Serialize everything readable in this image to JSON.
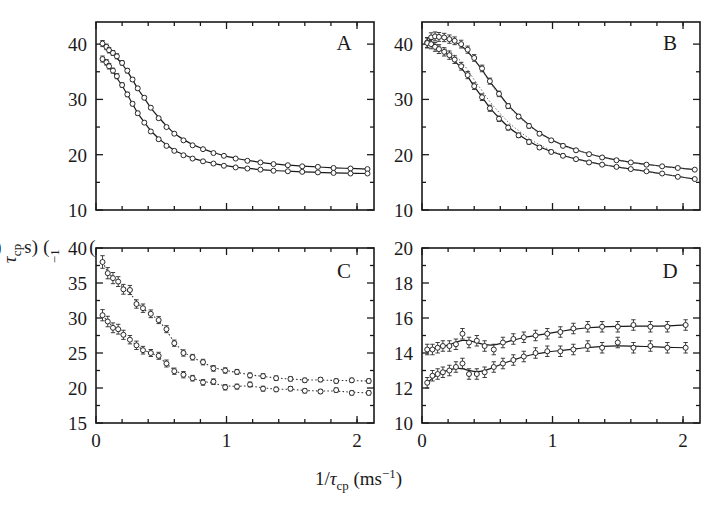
{
  "figure": {
    "axis": {
      "ylabel_prefix": "R",
      "ylabel_sub": "eff",
      "ylabel_mid": "(1/",
      "ylabel_tau": "τ",
      "ylabel_tau_sub": "cp",
      "ylabel_close": ") (s",
      "ylabel_sup": "−1",
      "ylabel_end": ")",
      "xlabel_prefix": "1/",
      "xlabel_tau": "τ",
      "xlabel_tau_sub": "cp",
      "xlabel_unit_open": " (ms",
      "xlabel_sup": "−1",
      "xlabel_unit_close": ")"
    },
    "colors": {
      "ink": "#1a1a1a",
      "marker_stroke": "#2b2b2b",
      "marker_fill": "#ffffff",
      "fit_solid": "#1a1a1a",
      "fit_dotted": "#3a3a3a",
      "frame": "#1a1a1a"
    }
  },
  "chart_data": [
    {
      "type": "scatter",
      "panel": "A",
      "label": "A",
      "title": "",
      "xlabel": "1/τcp (ms−1)",
      "ylabel": "Reff(1/τcp) (s−1)",
      "xlim": [
        0,
        2.13
      ],
      "ylim": [
        10,
        44
      ],
      "xticks": [
        0,
        1,
        2
      ],
      "xticklabels": [
        "0",
        "1",
        "2"
      ],
      "xminorticks": [
        0.2,
        0.4,
        0.6,
        0.8,
        1.2,
        1.4,
        1.6,
        1.8,
        2.0
      ],
      "yticks": [
        10,
        20,
        30,
        40
      ],
      "yticklabels": [
        "10",
        "20",
        "30",
        "40"
      ],
      "yminorticks": [
        15,
        25,
        35
      ],
      "grid": false,
      "legend": null,
      "series": [
        {
          "name": "upper-field",
          "fit_style": "solid",
          "x": [
            0.05,
            0.08,
            0.1,
            0.13,
            0.16,
            0.2,
            0.24,
            0.28,
            0.32,
            0.37,
            0.42,
            0.48,
            0.54,
            0.6,
            0.67,
            0.74,
            0.82,
            0.9,
            0.98,
            1.07,
            1.16,
            1.26,
            1.36,
            1.47,
            1.58,
            1.7,
            1.82,
            1.95,
            2.08
          ],
          "y": [
            40.1,
            39.5,
            38.9,
            38.4,
            37.8,
            36.6,
            35.2,
            33.6,
            32.0,
            30.3,
            28.5,
            26.6,
            25.0,
            23.8,
            22.6,
            21.7,
            21.0,
            20.3,
            19.8,
            19.3,
            18.9,
            18.6,
            18.3,
            18.1,
            17.9,
            17.8,
            17.6,
            17.5,
            17.4
          ],
          "yerr": [
            0.55,
            0.5,
            0.5,
            0.45,
            0.45,
            0.4,
            0.4,
            0.35,
            0.35,
            0.3,
            0.3,
            0.3,
            0.25,
            0.25,
            0.25,
            0.22,
            0.22,
            0.2,
            0.2,
            0.2,
            0.2,
            0.18,
            0.18,
            0.18,
            0.18,
            0.18,
            0.18,
            0.18,
            0.18
          ]
        },
        {
          "name": "lower-field",
          "fit_style": "solid",
          "x": [
            0.05,
            0.08,
            0.1,
            0.13,
            0.16,
            0.2,
            0.24,
            0.28,
            0.32,
            0.37,
            0.42,
            0.48,
            0.54,
            0.6,
            0.67,
            0.74,
            0.82,
            0.9,
            0.98,
            1.07,
            1.16,
            1.26,
            1.36,
            1.47,
            1.58,
            1.7,
            1.82,
            1.95,
            2.08
          ],
          "y": [
            37.3,
            36.7,
            36.0,
            35.2,
            34.2,
            32.6,
            30.9,
            29.2,
            27.5,
            25.8,
            24.2,
            22.8,
            21.6,
            20.7,
            19.9,
            19.3,
            18.8,
            18.4,
            18.0,
            17.7,
            17.5,
            17.3,
            17.1,
            17.0,
            16.9,
            16.8,
            16.7,
            16.6,
            16.6
          ],
          "yerr": [
            0.55,
            0.5,
            0.5,
            0.45,
            0.45,
            0.4,
            0.4,
            0.35,
            0.35,
            0.3,
            0.3,
            0.3,
            0.25,
            0.25,
            0.25,
            0.22,
            0.22,
            0.2,
            0.2,
            0.2,
            0.2,
            0.18,
            0.18,
            0.18,
            0.18,
            0.18,
            0.18,
            0.18,
            0.18
          ]
        }
      ]
    },
    {
      "type": "scatter",
      "panel": "B",
      "label": "B",
      "title": "",
      "xlabel": "1/τcp (ms−1)",
      "ylabel": "Reff(1/τcp) (s−1)",
      "xlim": [
        0,
        2.13
      ],
      "ylim": [
        10,
        44
      ],
      "xticks": [
        0,
        1,
        2
      ],
      "xticklabels": [
        "0",
        "1",
        "2"
      ],
      "xminorticks": [
        0.2,
        0.4,
        0.6,
        0.8,
        1.2,
        1.4,
        1.6,
        1.8,
        2.0
      ],
      "yticks": [
        10,
        20,
        30,
        40
      ],
      "yticklabels": [
        "10",
        "20",
        "30",
        "40"
      ],
      "yminorticks": [
        15,
        25,
        35
      ],
      "grid": false,
      "legend": null,
      "series": [
        {
          "name": "upper-field",
          "fit_style": "solid-with-dotted-alt",
          "x": [
            0.04,
            0.07,
            0.1,
            0.13,
            0.17,
            0.21,
            0.25,
            0.3,
            0.35,
            0.4,
            0.46,
            0.52,
            0.59,
            0.66,
            0.74,
            0.82,
            0.9,
            0.99,
            1.08,
            1.18,
            1.28,
            1.38,
            1.49,
            1.6,
            1.72,
            1.84,
            1.96,
            2.09
          ],
          "y": [
            40.3,
            41.2,
            41.4,
            41.3,
            41.2,
            40.9,
            40.6,
            40.0,
            39.0,
            37.5,
            35.6,
            33.3,
            31.0,
            28.8,
            26.9,
            25.2,
            23.8,
            22.6,
            21.6,
            20.8,
            20.1,
            19.5,
            19.0,
            18.6,
            18.2,
            17.9,
            17.6,
            17.3
          ],
          "yerr": [
            0.9,
            0.85,
            0.8,
            0.8,
            0.75,
            0.75,
            0.7,
            0.7,
            0.65,
            0.6,
            0.6,
            0.55,
            0.5,
            0.45,
            0.4,
            0.4,
            0.35,
            0.3,
            0.3,
            0.3,
            0.28,
            0.25,
            0.25,
            0.22,
            0.22,
            0.2,
            0.2,
            0.2
          ]
        },
        {
          "name": "lower-field",
          "fit_style": "solid-with-dotted-alt",
          "x": [
            0.04,
            0.07,
            0.1,
            0.13,
            0.17,
            0.21,
            0.25,
            0.3,
            0.35,
            0.4,
            0.46,
            0.52,
            0.59,
            0.66,
            0.74,
            0.82,
            0.9,
            0.99,
            1.08,
            1.18,
            1.28,
            1.38,
            1.49,
            1.6,
            1.72,
            1.84,
            1.96,
            2.09
          ],
          "y": [
            40.2,
            40.0,
            39.5,
            39.1,
            38.6,
            38.0,
            37.2,
            36.0,
            34.4,
            32.4,
            30.4,
            28.4,
            26.5,
            24.9,
            23.5,
            22.3,
            21.3,
            20.5,
            19.8,
            19.2,
            18.6,
            18.2,
            17.8,
            17.4,
            17.0,
            16.6,
            16.0,
            15.6
          ],
          "yerr": [
            0.9,
            0.85,
            0.8,
            0.8,
            0.75,
            0.75,
            0.7,
            0.7,
            0.65,
            0.6,
            0.6,
            0.55,
            0.5,
            0.45,
            0.4,
            0.4,
            0.35,
            0.3,
            0.3,
            0.3,
            0.28,
            0.25,
            0.25,
            0.22,
            0.22,
            0.2,
            0.2,
            0.2
          ]
        }
      ]
    },
    {
      "type": "scatter",
      "panel": "C",
      "label": "C",
      "title": "",
      "xlabel": "1/τcp (ms−1)",
      "ylabel": "Reff(1/τcp) (s−1)",
      "xlim": [
        0,
        2.13
      ],
      "ylim": [
        15,
        40
      ],
      "xticks": [
        0,
        1,
        2
      ],
      "xticklabels": [
        "0",
        "1",
        "2"
      ],
      "xminorticks": [
        0.2,
        0.4,
        0.6,
        0.8,
        1.2,
        1.4,
        1.6,
        1.8,
        2.0
      ],
      "yticks": [
        15,
        20,
        25,
        30,
        35,
        40
      ],
      "yticklabels": [
        "15",
        "20",
        "25",
        "30",
        "35",
        "40"
      ],
      "yminorticks": [
        17.5,
        22.5,
        27.5,
        32.5,
        37.5
      ],
      "grid": false,
      "legend": null,
      "series": [
        {
          "name": "upper-field",
          "fit_style": "dotted",
          "x": [
            0.05,
            0.09,
            0.13,
            0.17,
            0.21,
            0.26,
            0.31,
            0.36,
            0.42,
            0.48,
            0.54,
            0.6,
            0.67,
            0.74,
            0.82,
            0.9,
            0.99,
            1.08,
            1.18,
            1.28,
            1.38,
            1.49,
            1.6,
            1.72,
            1.84,
            1.96,
            2.09
          ],
          "y": [
            38.0,
            36.4,
            35.7,
            35.2,
            34.1,
            34.0,
            32.0,
            31.4,
            30.6,
            29.7,
            28.4,
            26.4,
            25.0,
            24.4,
            23.7,
            22.8,
            22.5,
            22.3,
            21.8,
            21.7,
            21.4,
            21.3,
            21.1,
            21.2,
            21.0,
            21.1,
            21.0
          ],
          "yerr": [
            0.9,
            0.8,
            0.8,
            0.7,
            0.7,
            0.65,
            0.6,
            0.6,
            0.55,
            0.5,
            0.5,
            0.45,
            0.45,
            0.4,
            0.4,
            0.4,
            0.38,
            0.35,
            0.35,
            0.35,
            0.32,
            0.3,
            0.3,
            0.3,
            0.3,
            0.3,
            0.3
          ]
        },
        {
          "name": "lower-field",
          "fit_style": "dotted",
          "x": [
            0.05,
            0.09,
            0.13,
            0.17,
            0.21,
            0.26,
            0.31,
            0.36,
            0.42,
            0.48,
            0.54,
            0.6,
            0.67,
            0.74,
            0.82,
            0.9,
            0.99,
            1.08,
            1.18,
            1.28,
            1.38,
            1.49,
            1.6,
            1.72,
            1.84,
            1.96,
            2.09
          ],
          "y": [
            30.4,
            29.5,
            28.6,
            28.4,
            27.6,
            26.9,
            26.1,
            25.4,
            25.0,
            24.6,
            23.5,
            22.4,
            21.9,
            21.4,
            20.8,
            20.9,
            20.1,
            20.2,
            20.5,
            19.9,
            19.8,
            19.9,
            19.6,
            19.5,
            19.7,
            19.3,
            19.3
          ],
          "yerr": [
            0.8,
            0.75,
            0.7,
            0.7,
            0.65,
            0.6,
            0.6,
            0.55,
            0.5,
            0.5,
            0.5,
            0.45,
            0.45,
            0.4,
            0.4,
            0.4,
            0.38,
            0.35,
            0.35,
            0.35,
            0.32,
            0.3,
            0.3,
            0.3,
            0.3,
            0.3,
            0.3
          ]
        }
      ]
    },
    {
      "type": "scatter",
      "panel": "D",
      "label": "D",
      "title": "",
      "xlabel": "1/τcp (ms−1)",
      "ylabel": "Reff(1/τcp) (s−1)",
      "xlim": [
        0,
        2.13
      ],
      "ylim": [
        10,
        20
      ],
      "xticks": [
        0,
        1,
        2
      ],
      "xticklabels": [
        "0",
        "1",
        "2"
      ],
      "xminorticks": [
        0.2,
        0.4,
        0.6,
        0.8,
        1.2,
        1.4,
        1.6,
        1.8,
        2.0
      ],
      "yticks": [
        10,
        12,
        14,
        16,
        18,
        20
      ],
      "yticklabels": [
        "10",
        "12",
        "14",
        "16",
        "18",
        "20"
      ],
      "yminorticks": [
        11,
        13,
        15,
        17,
        19
      ],
      "grid": false,
      "legend": null,
      "series": [
        {
          "name": "upper-field",
          "fit_style": "solid",
          "x": [
            0.04,
            0.08,
            0.12,
            0.16,
            0.21,
            0.26,
            0.31,
            0.36,
            0.42,
            0.48,
            0.55,
            0.62,
            0.7,
            0.78,
            0.87,
            0.96,
            1.06,
            1.16,
            1.27,
            1.38,
            1.5,
            1.62,
            1.75,
            1.88,
            2.02
          ],
          "y": [
            14.2,
            14.2,
            14.3,
            14.4,
            14.4,
            14.5,
            15.1,
            14.6,
            14.7,
            14.4,
            14.2,
            14.6,
            14.8,
            14.9,
            15.0,
            15.1,
            15.2,
            15.4,
            15.5,
            15.5,
            15.5,
            15.6,
            15.5,
            15.5,
            15.6
          ],
          "yerr": [
            0.3,
            0.3,
            0.3,
            0.3,
            0.3,
            0.3,
            0.3,
            0.3,
            0.3,
            0.3,
            0.3,
            0.3,
            0.3,
            0.3,
            0.3,
            0.3,
            0.3,
            0.3,
            0.3,
            0.3,
            0.3,
            0.3,
            0.3,
            0.3,
            0.3
          ]
        },
        {
          "name": "lower-field",
          "fit_style": "solid",
          "x": [
            0.04,
            0.08,
            0.12,
            0.16,
            0.21,
            0.26,
            0.31,
            0.36,
            0.42,
            0.48,
            0.55,
            0.62,
            0.7,
            0.78,
            0.87,
            0.96,
            1.06,
            1.16,
            1.27,
            1.38,
            1.5,
            1.62,
            1.75,
            1.88,
            2.02
          ],
          "y": [
            12.3,
            12.7,
            12.8,
            12.9,
            13.0,
            13.2,
            13.4,
            12.8,
            12.8,
            12.9,
            13.2,
            13.4,
            13.6,
            13.8,
            14.0,
            14.1,
            14.1,
            14.2,
            14.4,
            14.3,
            14.6,
            14.3,
            14.4,
            14.3,
            14.3
          ],
          "yerr": [
            0.3,
            0.3,
            0.3,
            0.3,
            0.3,
            0.3,
            0.3,
            0.3,
            0.3,
            0.3,
            0.3,
            0.3,
            0.3,
            0.3,
            0.3,
            0.3,
            0.3,
            0.3,
            0.3,
            0.3,
            0.3,
            0.3,
            0.3,
            0.3,
            0.3
          ]
        }
      ]
    }
  ]
}
